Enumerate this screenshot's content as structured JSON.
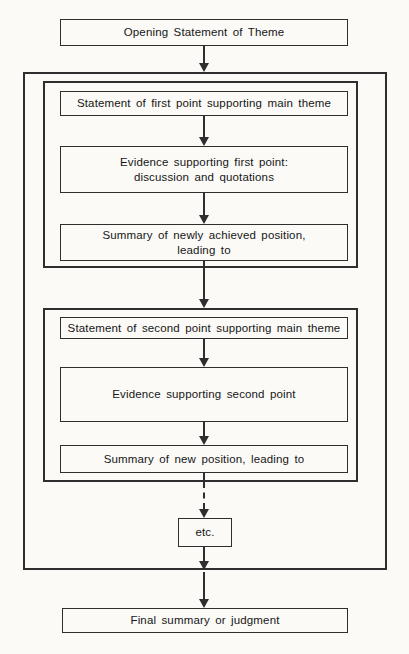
{
  "diagram": {
    "type": "flowchart",
    "colors": {
      "background": "#fbfaf7",
      "line": "#2e2e2e",
      "text": "#161616"
    },
    "nodes": {
      "opening": {
        "label": "Opening Statement of Theme"
      },
      "first_point": {
        "statement": "Statement of first point supporting main theme",
        "evidence_line1": "Evidence supporting first point:",
        "evidence_line2": "discussion and quotations",
        "summary_line1": "Summary of newly achieved position,",
        "summary_line2": "leading to"
      },
      "second_point": {
        "statement": "Statement of second point supporting main theme",
        "evidence": "Evidence supporting second point",
        "summary": "Summary of new position, leading to"
      },
      "etc": {
        "label": "etc."
      },
      "final": {
        "label": "Final summary or judgment"
      }
    },
    "edges": [
      {
        "from": "opening",
        "to": "main-body",
        "style": "solid"
      },
      {
        "from": "first-point-statement",
        "to": "first-point-evidence",
        "style": "solid"
      },
      {
        "from": "first-point-evidence",
        "to": "first-point-summary",
        "style": "solid"
      },
      {
        "from": "first-point-summary",
        "to": "second-point-group",
        "style": "solid"
      },
      {
        "from": "second-point-statement",
        "to": "second-point-evidence",
        "style": "solid"
      },
      {
        "from": "second-point-evidence",
        "to": "second-point-summary",
        "style": "solid"
      },
      {
        "from": "second-point-summary",
        "to": "etc",
        "style": "dashed"
      },
      {
        "from": "etc",
        "to": "main-body-bottom",
        "style": "solid"
      },
      {
        "from": "main-body-bottom",
        "to": "final",
        "style": "solid"
      }
    ]
  }
}
